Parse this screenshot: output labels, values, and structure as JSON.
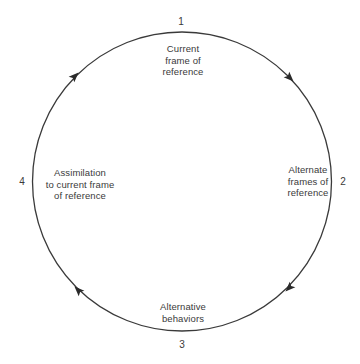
{
  "diagram": {
    "type": "cycle",
    "direction": "clockwise",
    "colors": {
      "line": "#3a3a3a",
      "text": "#3a3a3a",
      "background": "#ffffff"
    },
    "stages": [
      {
        "number": "1",
        "position": "top",
        "label_lines": [
          "Current",
          "frame of",
          "reference"
        ]
      },
      {
        "number": "2",
        "position": "right",
        "label_lines": [
          "Alternate",
          "frames of",
          "reference"
        ]
      },
      {
        "number": "3",
        "position": "bottom",
        "label_lines": [
          "Alternative",
          "behaviors"
        ]
      },
      {
        "number": "4",
        "position": "left",
        "label_lines": [
          "Assimilation",
          "to current frame",
          "of reference"
        ]
      }
    ],
    "arrows": [
      {
        "from": "1",
        "to": "2",
        "location": "upper-right"
      },
      {
        "from": "2",
        "to": "3",
        "location": "lower-right"
      },
      {
        "from": "3",
        "to": "4",
        "location": "lower-left"
      },
      {
        "from": "4",
        "to": "1",
        "location": "upper-left"
      }
    ]
  }
}
